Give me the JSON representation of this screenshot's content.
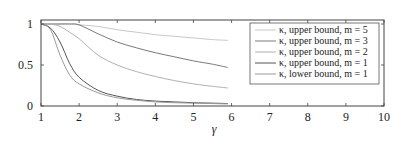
{
  "chart_data": {
    "type": "line",
    "title": "",
    "xlabel": "γ",
    "ylabel": "",
    "xlim": [
      1,
      10
    ],
    "ylim": [
      0,
      1.08
    ],
    "xticks": [
      1,
      2,
      3,
      4,
      5,
      6,
      7,
      8,
      9,
      10
    ],
    "yticks": [
      0,
      0.5,
      1
    ],
    "ytick_labels": [
      "0",
      "0.5",
      "1"
    ],
    "grid": false,
    "legend_position": "upper right",
    "x": [
      1,
      1.25,
      1.5,
      1.75,
      2,
      2.5,
      3,
      3.5,
      4,
      4.5,
      5,
      5.5,
      5.9
    ],
    "series": [
      {
        "name": "κ, upper bound, m = 5",
        "color": "#c8c8c8",
        "values": [
          1,
          1,
          1,
          1,
          0.99,
          0.97,
          0.93,
          0.9,
          0.87,
          0.85,
          0.83,
          0.81,
          0.8
        ]
      },
      {
        "name": "κ, upper bound, m = 3",
        "color": "#7a7a7a",
        "values": [
          1,
          1,
          1,
          1,
          0.99,
          0.88,
          0.78,
          0.71,
          0.65,
          0.6,
          0.55,
          0.51,
          0.47
        ]
      },
      {
        "name": "κ, upper bound, m = 2",
        "color": "#b0b0b0",
        "values": [
          1,
          1,
          0.97,
          0.9,
          0.82,
          0.62,
          0.5,
          0.42,
          0.36,
          0.31,
          0.27,
          0.24,
          0.22
        ]
      },
      {
        "name": "κ, upper bound, m = 1",
        "color": "#555555",
        "values": [
          1,
          0.95,
          0.78,
          0.52,
          0.35,
          0.19,
          0.12,
          0.08,
          0.06,
          0.05,
          0.04,
          0.035,
          0.03
        ]
      },
      {
        "name": "κ, lower bound, m = 1",
        "color": "#999999",
        "values": [
          1,
          0.93,
          0.62,
          0.38,
          0.27,
          0.16,
          0.1,
          0.07,
          0.05,
          0.04,
          0.035,
          0.03,
          0.025
        ]
      }
    ]
  }
}
